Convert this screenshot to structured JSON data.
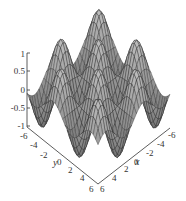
{
  "chart_data": {
    "type": "surface3d",
    "title": "",
    "function_guess": "z = sin(x)*sin(y)",
    "xlabel": "x",
    "ylabel": "y",
    "zlabel": "",
    "xlim": [
      -6,
      6
    ],
    "ylim": [
      -6,
      6
    ],
    "zlim": [
      -1,
      1
    ],
    "x_ticks": [
      "6",
      "4",
      "2",
      "0",
      "-2",
      "-4",
      "-6"
    ],
    "y_ticks": [
      "-6",
      "-4",
      "-2",
      "0",
      "2",
      "4",
      "6"
    ],
    "z_ticks": [
      "1",
      "0.5",
      "0",
      "-0.5",
      "-1"
    ],
    "grid": false,
    "legend": null,
    "style": {
      "surface_fill": "#a8a8a8",
      "mesh_color": "#222222",
      "axis_color": "#333333"
    }
  }
}
